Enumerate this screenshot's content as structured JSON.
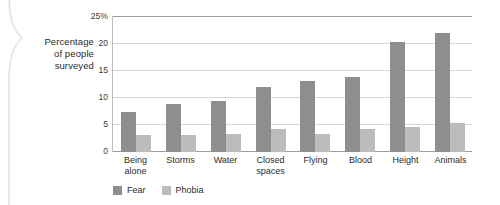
{
  "axis_title_lines": [
    "Percentage",
    "of people",
    "surveyed"
  ],
  "colors": {
    "fear": "#8e8e8e",
    "phobia": "#bcbcbc",
    "grid": "#d6d6d6",
    "axis": "#9e9e9e",
    "text": "#2b2b2b",
    "background": "#ffffff"
  },
  "legend": {
    "items": [
      {
        "label": "Fear",
        "swatch": "fear"
      },
      {
        "label": "Phobia",
        "swatch": "phobia"
      }
    ]
  },
  "chart_data": {
    "type": "bar",
    "title": "",
    "xlabel": "",
    "ylabel": "Percentage of people surveyed",
    "ylim": [
      0,
      25
    ],
    "yticks": [
      0,
      5,
      10,
      15,
      20,
      25
    ],
    "ytick_labels": [
      "0",
      "5",
      "10",
      "15",
      "20",
      "25%"
    ],
    "grid": true,
    "legend_position": "bottom-left",
    "categories": [
      "Being alone",
      "Storms",
      "Water",
      "Closed spaces",
      "Flying",
      "Blood",
      "Height",
      "Animals"
    ],
    "category_lines": [
      [
        "Being",
        "alone"
      ],
      [
        "Storms"
      ],
      [
        "Water"
      ],
      [
        "Closed",
        "spaces"
      ],
      [
        "Flying"
      ],
      [
        "Blood"
      ],
      [
        "Height"
      ],
      [
        "Animals"
      ]
    ],
    "series": [
      {
        "name": "Fear",
        "color": "#8e8e8e",
        "values": [
          7.4,
          8.8,
          9.4,
          12.0,
          13.2,
          13.9,
          20.3,
          22.0
        ]
      },
      {
        "name": "Phobia",
        "color": "#bcbcbc",
        "values": [
          3.1,
          3.2,
          3.4,
          4.2,
          3.4,
          4.3,
          4.7,
          5.4
        ]
      }
    ]
  }
}
